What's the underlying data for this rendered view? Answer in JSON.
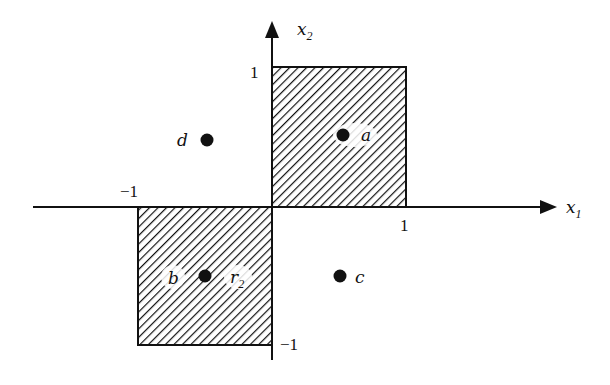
{
  "diagram": {
    "axes": {
      "x_label": "x",
      "x_label_sub": "1",
      "y_label": "x",
      "y_label_sub": "2",
      "ticks": {
        "x_pos": "1",
        "x_neg": "−1",
        "y_pos": "1",
        "y_neg": "−1"
      }
    },
    "regions": [
      {
        "name": "upper-right-square",
        "x_range": [
          0,
          1
        ],
        "y_range": [
          0,
          1
        ],
        "fill": "hatched"
      },
      {
        "name": "lower-left-square",
        "x_range": [
          -1,
          0
        ],
        "y_range": [
          -1,
          0
        ],
        "fill": "hatched"
      }
    ],
    "points": {
      "a": {
        "label": "a",
        "x": 0.5,
        "y": 0.5
      },
      "b": {
        "label": "b",
        "x": -0.5,
        "y": -0.5,
        "extra_label": "r",
        "extra_label_sub": "2"
      },
      "c": {
        "label": "c",
        "x": 0.5,
        "y": -0.5
      },
      "d": {
        "label": "d",
        "x": -0.5,
        "y": 0.5
      }
    },
    "colors": {
      "ink": "#111111",
      "background": "#ffffff"
    }
  }
}
